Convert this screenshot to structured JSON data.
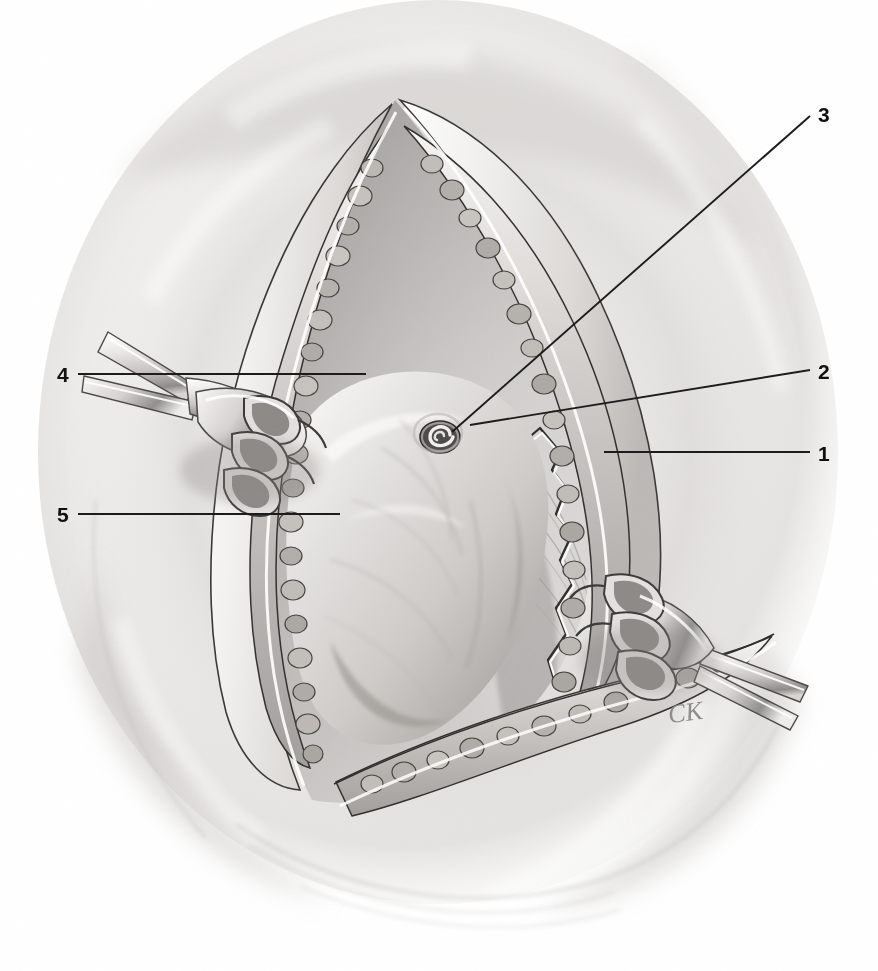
{
  "illustration": {
    "title": "Surgical field: midline abdominal incision exposure",
    "medium": "graphite pencil medical illustration",
    "background_color": "#ffffff",
    "ink_color": "#111111",
    "signature": "CK",
    "signature_position": {
      "x": 668,
      "y": 698
    }
  },
  "labels": [
    {
      "id": "1",
      "text": "1",
      "x": 818,
      "y": 443,
      "side": "right",
      "leader": {
        "x1": 810,
        "y1": 452,
        "x2": 604,
        "y2": 452
      }
    },
    {
      "id": "2",
      "text": "2",
      "x": 818,
      "y": 361,
      "side": "right",
      "leader": {
        "x1": 810,
        "y1": 370,
        "x2": 470,
        "y2": 425
      }
    },
    {
      "id": "3",
      "text": "3",
      "x": 818,
      "y": 104,
      "side": "right",
      "leader": {
        "x1": 810,
        "y1": 116,
        "x2": 452,
        "y2": 432
      }
    },
    {
      "id": "4",
      "text": "4",
      "x": 57,
      "y": 364,
      "side": "left",
      "leader": {
        "x1": 78,
        "y1": 374,
        "x2": 366,
        "y2": 374
      }
    },
    {
      "id": "5",
      "text": "5",
      "x": 57,
      "y": 504,
      "side": "left",
      "leader": {
        "x1": 78,
        "y1": 514,
        "x2": 340,
        "y2": 514
      }
    }
  ],
  "scene": {
    "wound_apex_top": {
      "x": 395,
      "y": 100
    },
    "wound_apex_bottom": {
      "x": 312,
      "y": 800
    },
    "umbilicus": {
      "x": 440,
      "y": 437,
      "r": 18
    },
    "retractors": [
      {
        "name": "rake-retractor-upper-left",
        "x": 130,
        "y": 380,
        "angle": -28
      },
      {
        "name": "rake-retractor-lower-right",
        "x": 640,
        "y": 600,
        "angle": -36
      }
    ]
  },
  "palette": {
    "paper": "#ffffff",
    "tissue_light": "#e9e7e5",
    "tissue_mid": "#c9c6c3",
    "tissue_dark": "#9a9794",
    "shadow": "#6f6c6a",
    "line": "#2b2b2b",
    "fat_globule": "#b9b4b0",
    "fat_globule_dark": "#8e8a86",
    "metal_light": "#f2f1f0",
    "metal_dark": "#7d7b79"
  }
}
